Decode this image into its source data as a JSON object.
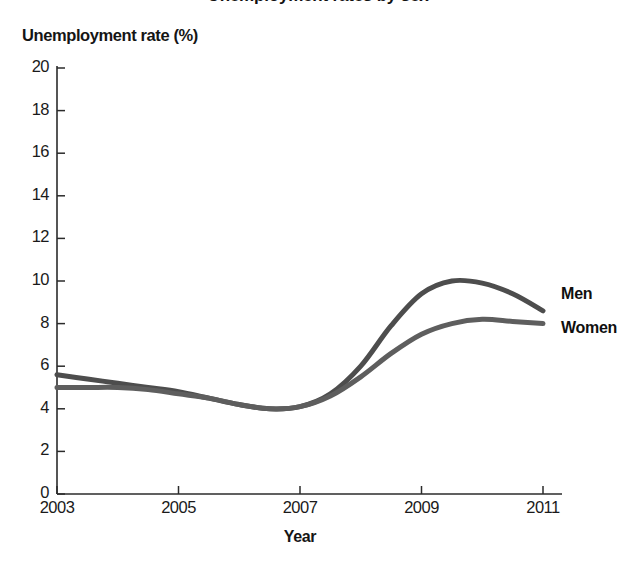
{
  "chart_data": {
    "type": "line",
    "title": "Unemployment rates by sex",
    "ylabel": "Unemployment rate (%)",
    "xlabel": "Year",
    "xlim": [
      2003,
      2011
    ],
    "ylim": [
      0,
      20
    ],
    "grid": false,
    "legend_position": "right-inline",
    "xticks": [
      "2003",
      "2005",
      "2007",
      "2009",
      "2011"
    ],
    "xtick_values": [
      2003,
      2005,
      2007,
      2009,
      2011
    ],
    "yticks": [
      "0",
      "2",
      "4",
      "6",
      "8",
      "10",
      "12",
      "14",
      "16",
      "18",
      "20"
    ],
    "ytick_values": [
      0,
      2,
      4,
      6,
      8,
      10,
      12,
      14,
      16,
      18,
      20
    ],
    "x": [
      2003,
      2003.5,
      2004,
      2004.5,
      2005,
      2005.5,
      2006,
      2006.5,
      2007,
      2007.5,
      2008,
      2008.5,
      2009,
      2009.5,
      2010,
      2010.5,
      2011
    ],
    "series": [
      {
        "name": "Men",
        "color": "#4d4d4d",
        "values": [
          5.6,
          5.4,
          5.2,
          5.0,
          4.8,
          4.5,
          4.2,
          4.0,
          4.1,
          4.7,
          6.0,
          7.9,
          9.4,
          10.0,
          9.9,
          9.4,
          8.6
        ]
      },
      {
        "name": "Women",
        "color": "#5e5e5e",
        "values": [
          5.0,
          5.0,
          5.0,
          4.9,
          4.7,
          4.5,
          4.2,
          4.0,
          4.1,
          4.6,
          5.5,
          6.6,
          7.5,
          8.0,
          8.2,
          8.1,
          8.0
        ]
      }
    ],
    "annotations": [
      {
        "text": "Men",
        "x": 2011.15,
        "y": 9.3
      },
      {
        "text": "Women",
        "x": 2011.15,
        "y": 7.7
      }
    ]
  }
}
